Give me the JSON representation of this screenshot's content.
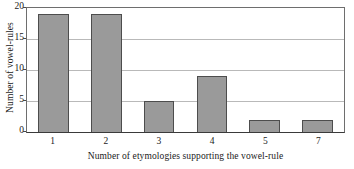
{
  "chart_data": {
    "type": "bar",
    "title": "",
    "subtitle": "",
    "xlabel": "Number of etymologies supporting the vowel-rule",
    "ylabel": "Number of vowel-rules",
    "categories": [
      "1",
      "2",
      "3",
      "4",
      "5",
      "7"
    ],
    "values": [
      19,
      19,
      5,
      9,
      2,
      2
    ],
    "series": [
      {
        "name": "Number of vowel-rules",
        "values": [
          19,
          19,
          5,
          9,
          2,
          2
        ]
      }
    ],
    "ylim": [
      0,
      20
    ],
    "yticks": [
      "20",
      "15",
      "10",
      "5",
      "0"
    ],
    "ytick_values": [
      20,
      15,
      10,
      5,
      0
    ],
    "grid": "horizontal",
    "gridlines_at": [
      5,
      10,
      15,
      20
    ],
    "legend": "none",
    "legend_position": "none",
    "colors": {
      "bar_fill": "#9a9a9a",
      "bar_edge": "#4d4d4d",
      "gridline": "#b9b9b9",
      "frame": "#6e6e6e",
      "background": "#ffffff",
      "text": "#1a1a1a"
    }
  }
}
